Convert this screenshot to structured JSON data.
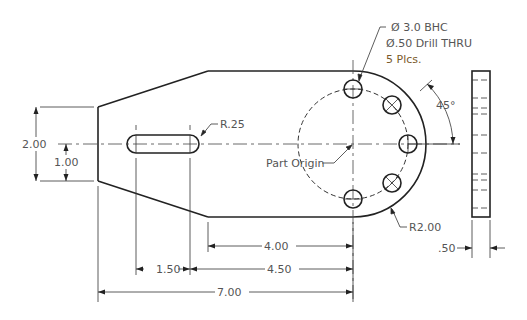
{
  "drawing": {
    "hole_note": {
      "line1": "Ø 3.0 BHC",
      "line2": "Ø.50 Drill THRU",
      "line3": "5 Plcs."
    },
    "slot_radius_label": "R.25",
    "angle_label": "45°",
    "origin_label": "Part Origin",
    "outer_radius_label": "R2.00",
    "dimensions": {
      "height_total": "2.00",
      "height_half": "1.00",
      "slot_to_origin_right": "4.00",
      "slot_length": "1.50",
      "slot_end_to_origin": "4.50",
      "overall_length": "7.00",
      "thickness": ".50"
    },
    "colors": {
      "object_line": "#222222",
      "dimension_text": "#555555",
      "note_text_accent": "#7a5a2a"
    }
  }
}
